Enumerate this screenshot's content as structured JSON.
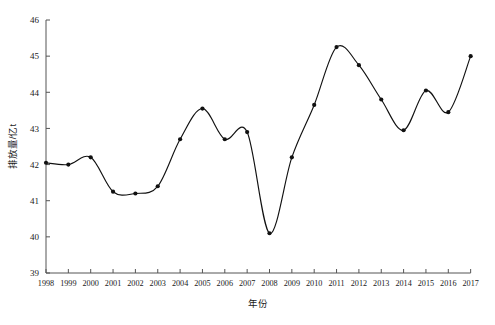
{
  "chart_data": {
    "type": "line",
    "title": "",
    "xlabel": "年份",
    "ylabel": "排放量/亿t",
    "categories": [
      "1998",
      "1999",
      "2000",
      "2001",
      "2002",
      "2003",
      "2004",
      "2005",
      "2006",
      "2007",
      "2008",
      "2009",
      "2010",
      "2011",
      "2012",
      "2013",
      "2014",
      "2015",
      "2016",
      "2017"
    ],
    "values": [
      42.05,
      42.0,
      42.2,
      41.25,
      41.2,
      41.4,
      42.7,
      43.55,
      42.7,
      42.9,
      40.1,
      42.2,
      43.65,
      45.25,
      44.75,
      43.8,
      42.95,
      44.05,
      43.45,
      45.0
    ],
    "series": [
      {
        "name": "排放量",
        "values": [
          42.05,
          42.0,
          42.2,
          41.25,
          41.2,
          41.4,
          42.7,
          43.55,
          42.7,
          42.9,
          40.1,
          42.2,
          43.65,
          45.25,
          44.75,
          43.8,
          42.95,
          44.05,
          43.45,
          45.0
        ]
      }
    ],
    "ylim": [
      39,
      46
    ],
    "xlim": [
      "1998",
      "2017"
    ],
    "yticks": [
      39,
      40,
      41,
      42,
      43,
      44,
      45,
      46
    ],
    "ytick_labels": [
      "39",
      "40",
      "41",
      "42",
      "43",
      "44",
      "45",
      "46"
    ],
    "xtick_labels": [
      "1998",
      "1999",
      "2000",
      "2001",
      "2002",
      "2003",
      "2004",
      "2005",
      "2006",
      "2007",
      "2008",
      "2009",
      "2010",
      "2011",
      "2012",
      "2013",
      "2014",
      "2015",
      "2016",
      "2017"
    ],
    "grid": false,
    "legend": "none",
    "marker": "filled-circle",
    "line_color": "#111111",
    "marker_color": "#111111",
    "axis_color": "#555555",
    "background_color": "#ffffff",
    "smoothing": "spline"
  },
  "axis": {
    "y_title": "排放量/亿t",
    "x_title": "年份"
  }
}
